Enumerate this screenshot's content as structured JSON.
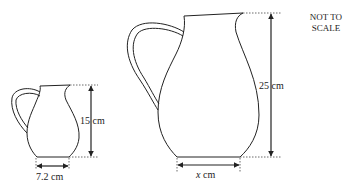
{
  "note": {
    "line1": "NOT TO",
    "line2": "SCALE"
  },
  "small_jug": {
    "height_label": "15 cm",
    "base_label": "7.2 cm"
  },
  "large_jug": {
    "height_label": "25 cm",
    "base_label_var": "x",
    "base_label_unit": " cm"
  },
  "colors": {
    "stroke": "#222222",
    "dotted": "#444444"
  }
}
